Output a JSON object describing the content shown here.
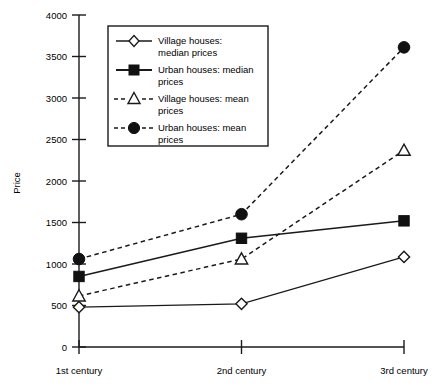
{
  "chart_data": {
    "type": "line",
    "title": "",
    "xlabel": "",
    "ylabel": "Price",
    "categories": [
      "1st  century",
      "2nd  century",
      "3rd  century"
    ],
    "ylim": [
      0,
      4000
    ],
    "yticks": [
      0,
      500,
      1000,
      1500,
      2000,
      2500,
      3000,
      3500,
      4000
    ],
    "ytick_labels": [
      "0",
      "500",
      "1000",
      "1500",
      "2000",
      "2500",
      "3000",
      "3500",
      "4000"
    ],
    "grid": false,
    "legend_position": "upper-left-inside",
    "series": [
      {
        "name": "Village houses:  median  prices",
        "marker": "open-diamond",
        "line": "solid",
        "values": [
          480,
          520,
          1085
        ]
      },
      {
        "name": "Urban houses:  median prices",
        "marker": "filled-square",
        "line": "solid",
        "values": [
          850,
          1310,
          1520
        ]
      },
      {
        "name": "Village houses:  mean prices",
        "marker": "open-triangle",
        "line": "dashed",
        "values": [
          615,
          1060,
          2370
        ]
      },
      {
        "name": "Urban houses:  mean prices",
        "marker": "filled-circle",
        "line": "dashed",
        "values": [
          1060,
          1600,
          3610
        ]
      }
    ]
  },
  "legend": {
    "entries": [
      {
        "line1": "Village  houses:",
        "line2": "median  prices"
      },
      {
        "line1": "Urban houses:  median",
        "line2": "prices"
      },
      {
        "line1": "Village houses:  mean",
        "line2": "prices"
      },
      {
        "line1": "Urban houses:  mean",
        "line2": "prices"
      }
    ]
  },
  "colors": {
    "ink": "#1a1a1a",
    "background": "#ffffff"
  }
}
